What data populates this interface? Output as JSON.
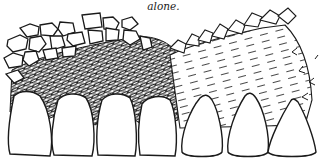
{
  "caption": {
    "text": "alone."
  },
  "figure": {
    "left_region": "crosshatched gingival tissue with cobblestone epithelium over four teeth",
    "right_region": "dashed-line connective tissue with broken border over three teeth",
    "left_teeth_count": 4,
    "right_teeth_count": 3
  },
  "colors": {
    "ink": "#1a1a1a",
    "paper": "#ffffff"
  }
}
